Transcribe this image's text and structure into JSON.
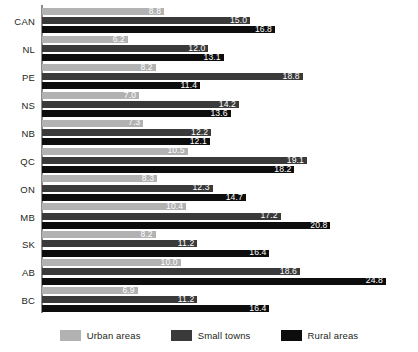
{
  "chart_data": {
    "type": "bar",
    "orientation": "horizontal",
    "title": "",
    "subtitle": "",
    "xlabel": "",
    "ylabel": "",
    "xlim": [
      0,
      27
    ],
    "grid": false,
    "legend_position": "bottom",
    "categories": [
      "CAN",
      "NL",
      "PE",
      "NS",
      "NB",
      "QC",
      "ON",
      "MB",
      "SK",
      "AB",
      "BC"
    ],
    "series": [
      {
        "name": "Urban areas",
        "color": "#b2b2b2",
        "values": [
          8.8,
          6.2,
          8.2,
          7.0,
          7.3,
          10.5,
          8.3,
          10.4,
          8.2,
          10.0,
          6.9
        ]
      },
      {
        "name": "Small towns",
        "color": "#3a3a3a",
        "values": [
          15.0,
          12.0,
          18.8,
          14.2,
          12.2,
          19.1,
          12.3,
          17.2,
          11.2,
          18.6,
          11.2
        ]
      },
      {
        "name": "Rural areas",
        "color": "#0d0d0d",
        "values": [
          16.8,
          13.1,
          11.4,
          13.6,
          12.1,
          18.2,
          14.7,
          20.8,
          16.4,
          24.8,
          16.4
        ]
      }
    ]
  },
  "legend": {
    "items": [
      {
        "label": "Urban areas",
        "swatch": "urban"
      },
      {
        "label": "Small towns",
        "swatch": "towns"
      },
      {
        "label": "Rural areas",
        "swatch": "rural"
      }
    ]
  }
}
